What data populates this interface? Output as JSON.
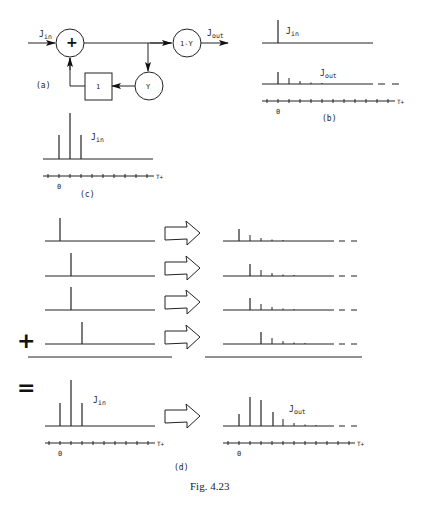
{
  "figure": {
    "caption": "Fig. 4.23",
    "panels": {
      "a": {
        "label": "(a)",
        "input": {
          "symbol": "J",
          "subscript": "in"
        },
        "output": {
          "symbol": "J",
          "subscript": "out"
        },
        "sum_node": "+",
        "delay_block": "1",
        "gain_feedback": "Y",
        "gain_output": "1-Y"
      },
      "b": {
        "label": "(b)",
        "input_label": {
          "symbol": "J",
          "subscript": "in"
        },
        "output_label": {
          "symbol": "J",
          "subscript": "out"
        },
        "axis_zero": "0",
        "axis_var": "T+"
      },
      "c": {
        "label": "(c)",
        "input_label": {
          "symbol": "J",
          "subscript": "in"
        },
        "axis_zero": "0",
        "axis_var": "T+"
      },
      "d": {
        "label": "(d)",
        "plus_sign": "+",
        "equals_sign": "=",
        "input_label": {
          "symbol": "J",
          "subscript": "in"
        },
        "output_label": {
          "symbol": "J",
          "subscript": "out"
        },
        "axis_zero": "0",
        "axis_var": "T+"
      }
    }
  }
}
